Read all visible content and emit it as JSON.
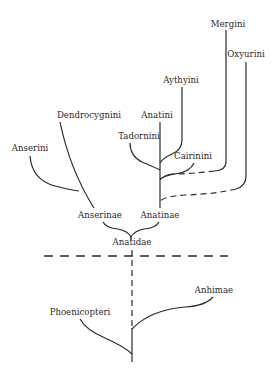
{
  "diagram": {
    "type": "phylogenetic-tree",
    "colors": {
      "line": "#2a2a2a",
      "background": "#ffffff"
    },
    "taxa": {
      "mergini": "Mergini",
      "oxyurini": "Oxyurini",
      "aythyini": "Aythyini",
      "anatini": "Anatini",
      "tadornini": "Tadornini",
      "cairinini": "Cairinini",
      "dendrocygnini": "Dendrocygnini",
      "anserini": "Anserini",
      "anserinae": "Anserinae",
      "anatinae": "Anatinae",
      "anatidae": "Anatidae",
      "anhimae": "Anhimae",
      "phoenicopteri": "Phoenicopteri"
    }
  }
}
